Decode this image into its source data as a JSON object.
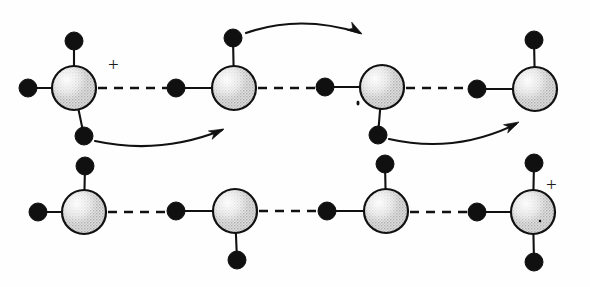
{
  "figure": {
    "background_color": "#ffffff",
    "ink_color": "#111111",
    "oxygen_fill": "#d9d9d9",
    "oxygen_highlight": "#ffffff",
    "hydrogen_color": "#101010",
    "width": 590,
    "height": 287
  },
  "charge_labels": [
    {
      "name": "plus-top-left",
      "text": "+",
      "x": 108,
      "y": 55
    },
    {
      "name": "plus-bottom-right",
      "text": "+",
      "x": 546,
      "y": 175
    }
  ],
  "rows": [
    {
      "name": "top-row",
      "y": 88,
      "molecules": [
        {
          "id": "top-1",
          "species": "hydronium",
          "charge": "+",
          "center": {
            "x": 74,
            "y": 88
          },
          "radius": 22,
          "hydrogens": [
            {
              "name": "h-top",
              "x": 74,
              "y": 41,
              "r": 9
            },
            {
              "name": "h-left",
              "x": 28,
              "y": 88,
              "r": 9
            },
            {
              "name": "h-bottom",
              "x": 84,
              "y": 136,
              "r": 9
            }
          ]
        },
        {
          "id": "top-2",
          "species": "water",
          "charge": "",
          "center": {
            "x": 234,
            "y": 88
          },
          "radius": 22,
          "hydrogens": [
            {
              "name": "h-top",
              "x": 233,
              "y": 38,
              "r": 9
            },
            {
              "name": "h-left",
              "x": 176,
              "y": 88,
              "r": 9
            }
          ]
        },
        {
          "id": "top-3",
          "species": "water",
          "charge": "",
          "center": {
            "x": 382,
            "y": 87
          },
          "radius": 22,
          "hydrogens": [
            {
              "name": "h-left",
              "x": 325,
              "y": 87,
              "r": 9
            },
            {
              "name": "h-bottom",
              "x": 378,
              "y": 135,
              "r": 9
            }
          ]
        },
        {
          "id": "top-4",
          "species": "water",
          "charge": "",
          "center": {
            "x": 535,
            "y": 89
          },
          "radius": 22,
          "hydrogens": [
            {
              "name": "h-top",
              "x": 534,
              "y": 40,
              "r": 9
            },
            {
              "name": "h-left",
              "x": 477,
              "y": 89,
              "r": 9
            }
          ]
        }
      ],
      "hydrogen_bonds": [
        {
          "name": "hbond-1",
          "x1": 98,
          "x2": 167,
          "y": 88
        },
        {
          "name": "hbond-2",
          "x1": 258,
          "x2": 316,
          "y": 88
        },
        {
          "name": "hbond-3",
          "x1": 406,
          "x2": 468,
          "y": 88
        }
      ]
    },
    {
      "name": "bottom-row",
      "y": 212,
      "molecules": [
        {
          "id": "bottom-1",
          "species": "water",
          "charge": "",
          "center": {
            "x": 84,
            "y": 212
          },
          "radius": 22,
          "hydrogens": [
            {
              "name": "h-top",
              "x": 85,
              "y": 166,
              "r": 9
            },
            {
              "name": "h-left",
              "x": 38,
              "y": 212,
              "r": 9
            }
          ]
        },
        {
          "id": "bottom-2",
          "species": "water",
          "charge": "",
          "center": {
            "x": 235,
            "y": 211
          },
          "radius": 22,
          "hydrogens": [
            {
              "name": "h-left",
              "x": 176,
              "y": 211,
              "r": 9
            },
            {
              "name": "h-bottom",
              "x": 237,
              "y": 260,
              "r": 9
            }
          ]
        },
        {
          "id": "bottom-3",
          "species": "water",
          "charge": "",
          "center": {
            "x": 386,
            "y": 211
          },
          "radius": 22,
          "hydrogens": [
            {
              "name": "h-top",
              "x": 385,
              "y": 164,
              "r": 9
            },
            {
              "name": "h-left",
              "x": 327,
              "y": 211,
              "r": 9
            }
          ]
        },
        {
          "id": "bottom-4",
          "species": "hydronium",
          "charge": "+",
          "center": {
            "x": 533,
            "y": 212
          },
          "radius": 22,
          "hydrogens": [
            {
              "name": "h-top",
              "x": 534,
              "y": 163,
              "r": 9
            },
            {
              "name": "h-left",
              "x": 477,
              "y": 212,
              "r": 9
            },
            {
              "name": "h-bottom",
              "x": 534,
              "y": 262,
              "r": 9
            }
          ]
        }
      ],
      "hydrogen_bonds": [
        {
          "name": "hbond-1",
          "x1": 108,
          "x2": 167,
          "y": 212
        },
        {
          "name": "hbond-2",
          "x1": 259,
          "x2": 318,
          "y": 211
        },
        {
          "name": "hbond-3",
          "x1": 410,
          "x2": 468,
          "y": 212
        }
      ]
    }
  ],
  "arrows": [
    {
      "name": "proton-transfer-arrow-1",
      "description": "top H of second top molecule hops to the right",
      "path": "M 246 33 Q 300 14 360 33",
      "head": {
        "x": 362,
        "y": 34,
        "angle": 32
      }
    },
    {
      "name": "proton-transfer-arrow-2",
      "description": "bottom H of first top molecule hops down-right",
      "path": "M 95 141 Q 160 155 222 130",
      "head": {
        "x": 224,
        "y": 129,
        "angle": -24
      }
    },
    {
      "name": "proton-transfer-arrow-3",
      "description": "bottom H of third top molecule hops down-right",
      "path": "M 389 139 Q 455 154 516 124",
      "head": {
        "x": 519,
        "y": 122,
        "angle": -27
      }
    }
  ],
  "stray_marks": [
    {
      "name": "stray-mark-top-3",
      "x": 358,
      "y": 103,
      "w": 3,
      "h": 5
    },
    {
      "name": "stray-mark-bottom-4",
      "x": 540,
      "y": 221,
      "w": 2.5,
      "h": 2.5
    }
  ]
}
